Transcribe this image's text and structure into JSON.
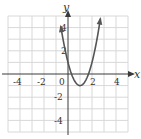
{
  "chart_data": {
    "type": "line",
    "title": "",
    "xlabel": "x",
    "ylabel": "y",
    "xlim": [
      -5,
      5
    ],
    "ylim": [
      -5,
      5
    ],
    "grid": true,
    "x_tick_labels": [
      "-4",
      "-2",
      "0",
      "2",
      "4"
    ],
    "y_tick_labels": [
      "4",
      "2",
      "-2",
      "-4"
    ],
    "series": [
      {
        "name": "parabola",
        "equation": "y = 2(x - 1)^2 - 1",
        "vertex": [
          1,
          -1
        ],
        "x": [
          -0.6,
          -0.5,
          0,
          0.29,
          0.5,
          1,
          1.5,
          1.71,
          2,
          2.5,
          2.7
        ],
        "y": [
          4.12,
          3.5,
          1,
          0,
          -0.5,
          -1,
          -0.5,
          0,
          1,
          3.5,
          4.78
        ],
        "arrows_on_both_ends": true
      }
    ],
    "colors": {
      "grid": "#d8d8d8",
      "axis": "#3a3a3a",
      "curve": "#555555"
    }
  },
  "labels": {
    "x_axis": "x",
    "y_axis": "y",
    "x_ticks": {
      "m4": "-4",
      "m2": "-2",
      "zero": "0",
      "p2": "2",
      "p4": "4"
    },
    "y_ticks": {
      "p4": "4",
      "p2": "2",
      "m2": "-2",
      "m4": "-4"
    }
  }
}
